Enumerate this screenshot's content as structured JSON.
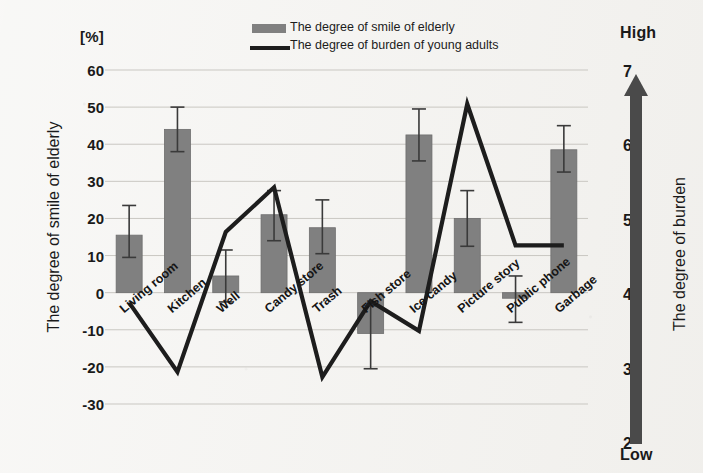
{
  "legend": {
    "bar_label": "The degree of smile of elderly",
    "line_label": "The degree of burden of young adults",
    "bar_swatch_name": "bar-legend-swatch",
    "line_swatch_name": "line-legend-swatch"
  },
  "axes": {
    "left_unit": "[%]",
    "left_title": "The degree of smile of elderly",
    "right_title": "The degree of burden",
    "right_high": "High",
    "right_low": "Low",
    "left_ticks": [
      "60",
      "50",
      "40",
      "30",
      "20",
      "10",
      "0",
      "-10",
      "-20",
      "-30"
    ],
    "right_ticks": [
      "7",
      "6",
      "5",
      "4",
      "3",
      "2"
    ]
  },
  "colors": {
    "bar_fill": "#808080",
    "bar_edge": "#6e6e6e",
    "line": "#1d1d1d",
    "error_bar": "#3a3a3a",
    "grid": "#c9c7c2",
    "right_axis_arrow": "#4a4a4a",
    "background": "#f2f1ee"
  },
  "chart_data": {
    "type": "bar",
    "title": "",
    "xlabel": "",
    "ylabel": "The degree of smile of elderly",
    "y2label": "The degree of burden",
    "ylim": [
      -30,
      60
    ],
    "y2lim": [
      2,
      7
    ],
    "grid": true,
    "legend_position": "top-center",
    "categories": [
      "Living room",
      "Kitchen",
      "Well",
      "Candy store",
      "Trash",
      "Fish store",
      "Ice candy",
      "Picture story",
      "Public phone",
      "Garbage"
    ],
    "series": [
      {
        "name": "The degree of smile of elderly",
        "type": "bar",
        "axis": "left",
        "unit": "%",
        "values": [
          15.5,
          44,
          4.5,
          21,
          17.5,
          -11,
          42.5,
          20,
          -1.5,
          38.5
        ],
        "error_upper": [
          23.5,
          50,
          11.5,
          27.5,
          25,
          -3.5,
          49.5,
          27.5,
          4.5,
          45
        ],
        "error_lower": [
          9.5,
          38,
          -2.5,
          14,
          10.5,
          -20.5,
          35.5,
          12.5,
          -8,
          32.5
        ]
      },
      {
        "name": "The degree of burden of young adults",
        "type": "line",
        "axis": "right",
        "values": [
          3.9,
          2.97,
          4.85,
          5.45,
          2.9,
          3.92,
          3.52,
          6.57,
          4.67,
          4.67
        ]
      }
    ]
  }
}
